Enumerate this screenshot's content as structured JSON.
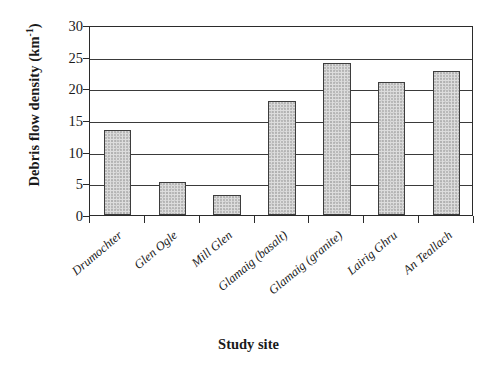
{
  "chart_data": {
    "type": "bar",
    "title": "",
    "xlabel": "Study site",
    "ylabel": "Debris flow density (km",
    "ylabel_sup": "-1",
    "ylabel_tail": ")",
    "ylabel_full": "Debris flow density (km-1)",
    "categories": [
      "Drumochter",
      "Glen Ogle",
      "Mill Glen",
      "Glamaig (basalt)",
      "Glamaig (granite)",
      "Lairig Ghru",
      "An Teallach"
    ],
    "values": [
      13.4,
      5.2,
      3.1,
      18.0,
      24.0,
      21.0,
      22.8
    ],
    "ylim": [
      0,
      30
    ],
    "yticks": [
      0,
      5,
      10,
      15,
      20,
      25,
      30
    ],
    "ytick_labels": [
      "0",
      "5",
      "10",
      "15",
      "20",
      "25",
      "30"
    ],
    "grid": true,
    "grid_axis": "y",
    "legend": "none",
    "bar_fill_color": "#dddddd",
    "bar_edge_color": "#3d3d3d",
    "axis_color": "#2b2b2b",
    "background_color": "#ffffff"
  }
}
